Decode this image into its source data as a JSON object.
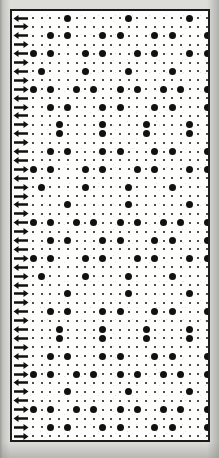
{
  "figure": {
    "kind": "halftone-dot-matrix-plate",
    "background_color": "#dcdcd8",
    "paper_color": "#fbfbfa",
    "ink_color": "#111111",
    "frame_color": "#1b1b1b",
    "frame": {
      "x": 10,
      "y": 9,
      "width": 200,
      "height": 433,
      "border_width": 2
    }
  },
  "grid": {
    "columns": 21,
    "rows": 48,
    "cell_width": 8.7,
    "cell_height": 8.9,
    "origin_x": 4,
    "origin_y": 7,
    "small_dot_px": 2,
    "large_dot_px": 7
  },
  "arrow_gutter": {
    "count": 48,
    "directions": [
      "left",
      "right",
      "left",
      "right",
      "left",
      "right",
      "left",
      "right",
      "right",
      "left",
      "right",
      "left",
      "right",
      "left",
      "right",
      "left",
      "left",
      "right",
      "left",
      "right",
      "right",
      "left",
      "right",
      "left",
      "right",
      "left",
      "left",
      "right",
      "left",
      "right",
      "left",
      "right",
      "right",
      "left",
      "right",
      "left",
      "left",
      "right",
      "left",
      "right",
      "right",
      "left",
      "right",
      "left",
      "right",
      "left",
      "right",
      "right"
    ],
    "icon_name": "arrow-marker-icon"
  },
  "chart_data": {
    "type": "heatmap",
    "title": "",
    "subtitle": "",
    "xlabel": "",
    "ylabel": "",
    "legend": [],
    "grid": true,
    "x": [
      0,
      1,
      2,
      3,
      4,
      5,
      6,
      7,
      8,
      9,
      10,
      11,
      12,
      13,
      14,
      15,
      16,
      17,
      18,
      19,
      20
    ],
    "value_levels": [
      1,
      2
    ],
    "level_meaning": {
      "1": "small dot",
      "2": "large dot"
    },
    "rows": [
      [
        1,
        1,
        1,
        1,
        2,
        1,
        1,
        1,
        1,
        1,
        1,
        2,
        1,
        1,
        1,
        1,
        1,
        1,
        2,
        1,
        1
      ],
      [
        1,
        1,
        1,
        1,
        1,
        1,
        1,
        1,
        1,
        1,
        1,
        1,
        1,
        1,
        1,
        1,
        1,
        1,
        1,
        1,
        1
      ],
      [
        1,
        1,
        2,
        1,
        2,
        1,
        1,
        1,
        2,
        1,
        2,
        1,
        1,
        1,
        2,
        1,
        2,
        1,
        1,
        1,
        2
      ],
      [
        1,
        1,
        1,
        1,
        1,
        1,
        1,
        1,
        1,
        1,
        1,
        1,
        1,
        1,
        1,
        1,
        1,
        1,
        1,
        1,
        1
      ],
      [
        2,
        1,
        2,
        1,
        1,
        1,
        2,
        1,
        2,
        1,
        1,
        1,
        2,
        1,
        2,
        1,
        1,
        1,
        2,
        1,
        2
      ],
      [
        1,
        1,
        1,
        1,
        1,
        1,
        1,
        1,
        1,
        1,
        1,
        1,
        1,
        1,
        1,
        1,
        1,
        1,
        1,
        1,
        1
      ],
      [
        1,
        2,
        1,
        1,
        1,
        1,
        2,
        1,
        1,
        1,
        1,
        2,
        1,
        1,
        1,
        1,
        2,
        1,
        1,
        1,
        1
      ],
      [
        1,
        1,
        1,
        1,
        1,
        1,
        1,
        1,
        1,
        1,
        1,
        1,
        1,
        1,
        1,
        1,
        1,
        1,
        1,
        1,
        1
      ],
      [
        2,
        1,
        2,
        1,
        1,
        2,
        1,
        2,
        1,
        1,
        2,
        1,
        2,
        1,
        1,
        2,
        1,
        2,
        1,
        1,
        2
      ],
      [
        1,
        1,
        1,
        1,
        1,
        1,
        1,
        1,
        1,
        1,
        1,
        1,
        1,
        1,
        1,
        1,
        1,
        1,
        1,
        1,
        1
      ],
      [
        1,
        1,
        2,
        1,
        2,
        1,
        1,
        1,
        2,
        1,
        2,
        1,
        1,
        1,
        2,
        1,
        2,
        1,
        1,
        1,
        2
      ],
      [
        1,
        1,
        1,
        1,
        1,
        1,
        1,
        1,
        1,
        1,
        1,
        1,
        1,
        1,
        1,
        1,
        1,
        1,
        1,
        1,
        1
      ],
      [
        1,
        1,
        1,
        2,
        1,
        1,
        1,
        1,
        2,
        1,
        1,
        1,
        1,
        2,
        1,
        1,
        1,
        1,
        2,
        1,
        1
      ],
      [
        1,
        1,
        1,
        2,
        1,
        1,
        1,
        1,
        2,
        1,
        1,
        1,
        1,
        2,
        1,
        1,
        1,
        1,
        2,
        1,
        1
      ],
      [
        1,
        1,
        1,
        1,
        1,
        1,
        1,
        1,
        1,
        1,
        1,
        1,
        1,
        1,
        1,
        1,
        1,
        1,
        1,
        1,
        1
      ],
      [
        1,
        1,
        2,
        1,
        2,
        1,
        1,
        1,
        2,
        1,
        2,
        1,
        1,
        1,
        2,
        1,
        2,
        1,
        1,
        1,
        2
      ],
      [
        1,
        1,
        1,
        1,
        1,
        1,
        1,
        1,
        1,
        1,
        1,
        1,
        1,
        1,
        1,
        1,
        1,
        1,
        1,
        1,
        1
      ],
      [
        2,
        1,
        2,
        1,
        1,
        1,
        2,
        1,
        2,
        1,
        1,
        1,
        2,
        1,
        2,
        1,
        1,
        1,
        2,
        1,
        2
      ],
      [
        1,
        1,
        1,
        1,
        1,
        1,
        1,
        1,
        1,
        1,
        1,
        1,
        1,
        1,
        1,
        1,
        1,
        1,
        1,
        1,
        1
      ],
      [
        1,
        2,
        1,
        1,
        1,
        1,
        2,
        1,
        1,
        1,
        1,
        2,
        1,
        1,
        1,
        1,
        2,
        1,
        1,
        1,
        1
      ],
      [
        1,
        1,
        1,
        1,
        1,
        1,
        1,
        1,
        1,
        1,
        1,
        1,
        1,
        1,
        1,
        1,
        1,
        1,
        1,
        1,
        1
      ],
      [
        1,
        1,
        1,
        1,
        2,
        1,
        1,
        1,
        1,
        1,
        1,
        2,
        1,
        1,
        1,
        1,
        1,
        1,
        2,
        1,
        1
      ],
      [
        1,
        1,
        1,
        1,
        1,
        1,
        1,
        1,
        1,
        1,
        1,
        1,
        1,
        1,
        1,
        1,
        1,
        1,
        1,
        1,
        1
      ],
      [
        2,
        1,
        2,
        1,
        1,
        2,
        1,
        2,
        1,
        1,
        2,
        1,
        2,
        1,
        1,
        2,
        1,
        2,
        1,
        1,
        2
      ],
      [
        1,
        1,
        1,
        1,
        1,
        1,
        1,
        1,
        1,
        1,
        1,
        1,
        1,
        1,
        1,
        1,
        1,
        1,
        1,
        1,
        1
      ],
      [
        1,
        1,
        2,
        1,
        2,
        1,
        1,
        1,
        2,
        1,
        2,
        1,
        1,
        1,
        2,
        1,
        2,
        1,
        1,
        1,
        2
      ],
      [
        1,
        1,
        1,
        1,
        1,
        1,
        1,
        1,
        1,
        1,
        1,
        1,
        1,
        1,
        1,
        1,
        1,
        1,
        1,
        1,
        1
      ],
      [
        2,
        1,
        2,
        1,
        1,
        1,
        2,
        1,
        2,
        1,
        1,
        1,
        2,
        1,
        2,
        1,
        1,
        1,
        2,
        1,
        2
      ],
      [
        1,
        1,
        1,
        1,
        1,
        1,
        1,
        1,
        1,
        1,
        1,
        1,
        1,
        1,
        1,
        1,
        1,
        1,
        1,
        1,
        1
      ],
      [
        1,
        2,
        1,
        1,
        1,
        1,
        2,
        1,
        1,
        1,
        1,
        2,
        1,
        1,
        1,
        1,
        2,
        1,
        1,
        1,
        1
      ],
      [
        1,
        1,
        1,
        1,
        1,
        1,
        1,
        1,
        1,
        1,
        1,
        1,
        1,
        1,
        1,
        1,
        1,
        1,
        1,
        1,
        1
      ],
      [
        1,
        1,
        1,
        1,
        2,
        1,
        1,
        1,
        1,
        1,
        1,
        2,
        1,
        1,
        1,
        1,
        1,
        1,
        2,
        1,
        1
      ],
      [
        1,
        1,
        1,
        1,
        1,
        1,
        1,
        1,
        1,
        1,
        1,
        1,
        1,
        1,
        1,
        1,
        1,
        1,
        1,
        1,
        1
      ],
      [
        1,
        1,
        2,
        1,
        2,
        1,
        1,
        1,
        2,
        1,
        2,
        1,
        1,
        1,
        2,
        1,
        2,
        1,
        1,
        1,
        2
      ],
      [
        1,
        1,
        1,
        1,
        1,
        1,
        1,
        1,
        1,
        1,
        1,
        1,
        1,
        1,
        1,
        1,
        1,
        1,
        1,
        1,
        1
      ],
      [
        1,
        1,
        1,
        2,
        1,
        1,
        1,
        1,
        2,
        1,
        1,
        1,
        1,
        2,
        1,
        1,
        1,
        1,
        2,
        1,
        1
      ],
      [
        1,
        1,
        1,
        2,
        1,
        1,
        1,
        1,
        2,
        1,
        1,
        1,
        1,
        2,
        1,
        1,
        1,
        1,
        2,
        1,
        1
      ],
      [
        1,
        1,
        1,
        1,
        1,
        1,
        1,
        1,
        1,
        1,
        1,
        1,
        1,
        1,
        1,
        1,
        1,
        1,
        1,
        1,
        1
      ],
      [
        1,
        1,
        2,
        1,
        2,
        1,
        1,
        1,
        2,
        1,
        2,
        1,
        1,
        1,
        2,
        1,
        2,
        1,
        1,
        1,
        2
      ],
      [
        1,
        1,
        1,
        1,
        1,
        1,
        1,
        1,
        1,
        1,
        1,
        1,
        1,
        1,
        1,
        1,
        1,
        1,
        1,
        1,
        1
      ],
      [
        2,
        1,
        2,
        1,
        1,
        2,
        1,
        2,
        1,
        1,
        2,
        1,
        2,
        1,
        1,
        2,
        1,
        2,
        1,
        1,
        2
      ],
      [
        1,
        1,
        1,
        1,
        1,
        1,
        1,
        1,
        1,
        1,
        1,
        1,
        1,
        1,
        1,
        1,
        1,
        1,
        1,
        1,
        1
      ],
      [
        1,
        1,
        1,
        1,
        2,
        1,
        1,
        1,
        1,
        1,
        1,
        2,
        1,
        1,
        1,
        1,
        1,
        1,
        2,
        1,
        1
      ],
      [
        1,
        1,
        1,
        1,
        1,
        1,
        1,
        1,
        1,
        1,
        1,
        1,
        1,
        1,
        1,
        1,
        1,
        1,
        1,
        1,
        1
      ],
      [
        2,
        1,
        2,
        1,
        1,
        2,
        1,
        2,
        1,
        1,
        2,
        1,
        2,
        1,
        1,
        2,
        1,
        2,
        1,
        1,
        2
      ],
      [
        1,
        1,
        1,
        1,
        1,
        1,
        1,
        1,
        1,
        1,
        1,
        1,
        1,
        1,
        1,
        1,
        1,
        1,
        1,
        1,
        1
      ],
      [
        1,
        1,
        2,
        1,
        2,
        1,
        1,
        1,
        2,
        1,
        2,
        1,
        1,
        1,
        2,
        1,
        2,
        1,
        1,
        1,
        2
      ],
      [
        1,
        1,
        1,
        1,
        1,
        1,
        1,
        1,
        1,
        1,
        1,
        1,
        1,
        1,
        1,
        1,
        1,
        1,
        1,
        1,
        1
      ]
    ]
  }
}
